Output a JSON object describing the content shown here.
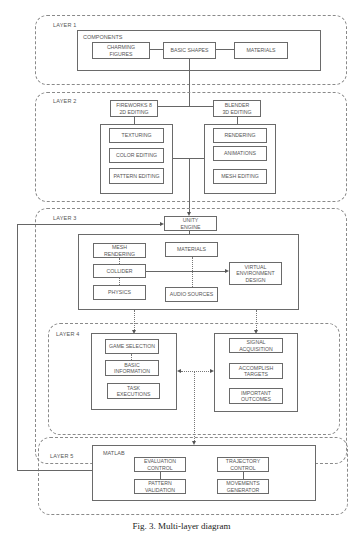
{
  "layers": [
    {
      "label": "LAYER 1"
    },
    {
      "label": "LAYER 2"
    },
    {
      "label": "LAYER 3"
    },
    {
      "label": "LAYER 4"
    },
    {
      "label": "LAYER 5"
    }
  ],
  "layer1": {
    "frame_label": "COMPONENTS",
    "boxes": [
      "CHARMING\nFIGURES",
      "BASIC SHAPES",
      "MATERIALS"
    ]
  },
  "layer2": {
    "left_header": "FIREWORKS 8\n2D EDITING",
    "right_header": "BLENDER\n3D EDITING",
    "left_boxes": [
      "TEXTURING",
      "COLOR EDITING",
      "PATTERN EDITING"
    ],
    "right_boxes": [
      "RENDERING",
      "ANIMATIONS",
      "MESH EDITING"
    ]
  },
  "layer3": {
    "engine": "UNITY\nENGINE",
    "left_boxes": [
      "MESH\nRENDERING",
      "COLLIDER",
      "PHYSICS"
    ],
    "mid_boxes": [
      "MATERIALS",
      "AUDIO SOURCES"
    ],
    "right_box": "VIRTUAL\nENVIRONMENT\nDESIGN"
  },
  "layer4": {
    "left_boxes": [
      "GAME SELECTION",
      "BASIC\nINFORMATION",
      "TASK EXECUTIONS"
    ],
    "right_boxes": [
      "SIGNAL\nACQUISITION",
      "ACCOMPLISH\nTARGETS",
      "IMPORTANT\nOUTCOMES"
    ]
  },
  "layer5": {
    "frame_label": "MATLAB",
    "left_boxes": [
      "EVALUATION\nCONTROL",
      "PATTERN\nVALIDATION"
    ],
    "right_boxes": [
      "TRAJECTORY\nCONTROL",
      "MOVEMENTS\nGENERATOR"
    ]
  },
  "caption": "Fig. 3.  Multi-layer diagram"
}
